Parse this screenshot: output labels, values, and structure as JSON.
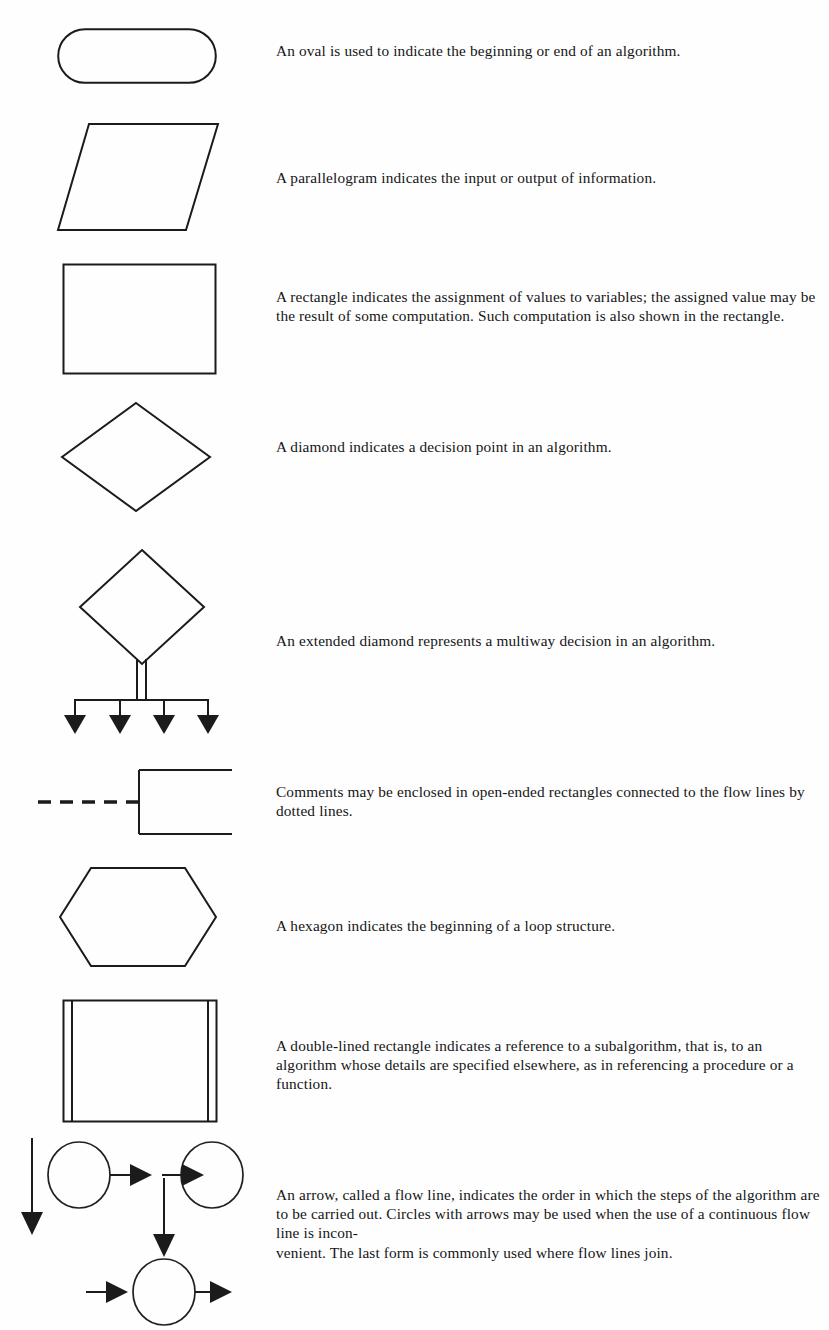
{
  "page": {
    "background_color": "#fefefe",
    "ink_color": "#1b1b1b"
  },
  "rows": [
    {
      "id": "oval",
      "symbol_name": "oval-shape",
      "description": "An oval is used to indicate the beginning or end of an algorithm."
    },
    {
      "id": "parallelogram",
      "symbol_name": "parallelogram-shape",
      "description": "A parallelogram indicates the input or output of information."
    },
    {
      "id": "rectangle",
      "symbol_name": "rectangle-shape",
      "description": "A rectangle indicates the assignment of values to variables; the assigned value may be the result of some computation.  Such computation is also shown in the rectangle."
    },
    {
      "id": "diamond",
      "symbol_name": "diamond-shape",
      "description": "A diamond indicates a decision point in an algorithm."
    },
    {
      "id": "extended-diamond",
      "symbol_name": "extended-diamond-shape",
      "description": "An extended diamond represents a multiway decision in an algorithm."
    },
    {
      "id": "comment",
      "symbol_name": "open-ended-rectangle-shape",
      "description": "Comments may be enclosed in open-ended rectangles connected to the flow lines by dotted lines."
    },
    {
      "id": "hexagon",
      "symbol_name": "hexagon-shape",
      "description": "A hexagon indicates the beginning of a loop structure."
    },
    {
      "id": "double-lined-rectangle",
      "symbol_name": "double-lined-rectangle-shape",
      "description": "A double-lined rectangle indicates a reference to a subalgorithm, that is, to an algorithm whose details are specified elsewhere, as in referencing a procedure or a function."
    },
    {
      "id": "flow-line",
      "symbol_name": "flow-line-arrows-shape",
      "description": "An arrow, called a flow line, indicates the order in which the steps of the algorithm are to be carried out.  Circles with arrows may be used when the use of a continuous flow line is incon-\nvenient.  The last form is commonly used where flow lines join."
    }
  ]
}
